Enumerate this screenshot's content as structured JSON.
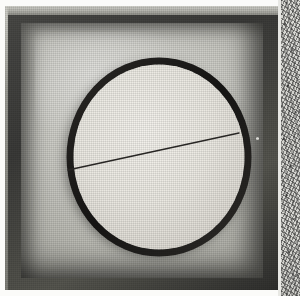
{
  "image": {
    "title": "Knurled disc in tray",
    "medium": "black-and-white halftone photograph",
    "caption": "Grayscale photograph of a round knurled disc resting inside a shallow square tray, with a fine straight scribe line crossing the disc face.",
    "width_px": 300,
    "height_px": 296
  },
  "palette": {
    "paper_white": "#fbfbf9",
    "box_wall_dark": "#3a3a38",
    "box_rim_light": "#cfcfc8",
    "interior_light": "#d8d8d2",
    "interior_mid": "#b9b9b2",
    "interior_shadow": "#8a8a83",
    "disc_face": "#eceae4",
    "disc_edge_dark": "#23211f",
    "scribe_line": "#2a2826",
    "grain_strip": "#cfcfca"
  },
  "scene": {
    "tray": {
      "name": "square tray",
      "outer_left_px": 5,
      "outer_top_px": 6,
      "outer_width_px": 274,
      "outer_height_px": 284,
      "interior_left_px": 21,
      "interior_top_px": 23,
      "interior_width_px": 242,
      "interior_height_px": 255,
      "wall_thickness_px": 16
    },
    "disc": {
      "name": "knurled disc",
      "center_x_px": 154,
      "center_y_px": 151,
      "radius_x_px": 89,
      "radius_y_px": 96,
      "tooth_count": 44,
      "tooth_depth_px": 5,
      "face_tone": "near-white",
      "edge_tone": "near-black"
    },
    "scribe_line": {
      "name": "diameter scribe line",
      "start_x_px": 68,
      "start_y_px": 170,
      "end_x_px": 239,
      "end_y_px": 133,
      "stroke_width_px": 1.4,
      "angle_deg": -12.2
    },
    "grain_strip": {
      "name": "granular film edge",
      "left_px": 281,
      "width_px": 19,
      "description": "speckled high-contrast film/paper edge along the right side"
    },
    "highlight": {
      "name": "blown highlight",
      "location": "upper-left of tray interior"
    },
    "speck": {
      "name": "white speck",
      "x_px": 251,
      "y_px": 131
    }
  },
  "labels": {
    "alt_text": "Photograph of a knurled circular disc inside a shallow square tray with a thin straight line drawn across the disc."
  }
}
